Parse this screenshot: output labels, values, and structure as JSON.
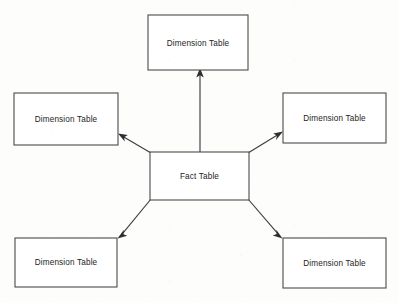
{
  "diagram": {
    "type": "star-schema",
    "canvas": {
      "width": 398,
      "height": 303
    },
    "colors": {
      "background": "#fdfdfc",
      "box_fill": "#ffffff",
      "box_stroke": "#4b4b4b",
      "edge_stroke": "#3d3d3d",
      "arrowhead": "#2e2e2e",
      "text": "#1d1d1d"
    },
    "nodes": [
      {
        "id": "dimension-top",
        "label": "Dimension Table",
        "role": "dimension",
        "x": 148,
        "y": 15,
        "width": 100,
        "height": 55
      },
      {
        "id": "dimension-left",
        "label": "Dimension Table",
        "role": "dimension",
        "x": 14,
        "y": 93,
        "width": 104,
        "height": 52
      },
      {
        "id": "dimension-right",
        "label": "Dimension Table",
        "role": "dimension",
        "x": 283,
        "y": 93,
        "width": 103,
        "height": 50
      },
      {
        "id": "fact-center",
        "label": "Fact Table",
        "role": "fact",
        "x": 150,
        "y": 152,
        "width": 99,
        "height": 48
      },
      {
        "id": "dimension-bottom-left",
        "label": "Dimension Table",
        "role": "dimension",
        "x": 15,
        "y": 238,
        "width": 102,
        "height": 49
      },
      {
        "id": "dimension-bottom-right",
        "label": "Dimension Table",
        "role": "dimension",
        "x": 283,
        "y": 238,
        "width": 103,
        "height": 50
      }
    ],
    "edges": [
      {
        "id": "fact-to-dimension-top",
        "from": "fact-center",
        "to": "dimension-top",
        "direction": "up",
        "x1": 200,
        "y1": 152,
        "x2": 200,
        "y2": 71
      },
      {
        "id": "fact-to-dimension-left",
        "from": "fact-center",
        "to": "dimension-left",
        "direction": "up-left",
        "x1": 151,
        "y1": 153,
        "x2": 119,
        "y2": 134
      },
      {
        "id": "fact-to-dimension-right",
        "from": "fact-center",
        "to": "dimension-right",
        "direction": "up-right",
        "x1": 248,
        "y1": 153,
        "x2": 282,
        "y2": 132
      },
      {
        "id": "fact-to-dimension-bottom-left",
        "from": "fact-center",
        "to": "dimension-bottom-left",
        "direction": "down-left",
        "x1": 151,
        "y1": 199,
        "x2": 118,
        "y2": 237
      },
      {
        "id": "fact-to-dimension-bottom-right",
        "from": "fact-center",
        "to": "dimension-bottom-right",
        "direction": "down-right",
        "x1": 248,
        "y1": 199,
        "x2": 282,
        "y2": 237
      }
    ]
  }
}
